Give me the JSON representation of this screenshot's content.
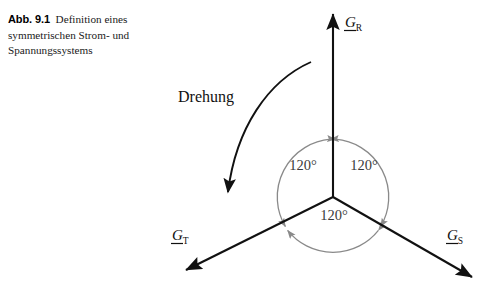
{
  "figure": {
    "caption_number": "Abb. 9.1",
    "caption_text": "Definition eines symmetrischen Strom- und Spannungssystems",
    "background_color": "#ffffff"
  },
  "diagram": {
    "origin": {
      "x": 333,
      "y": 197
    },
    "vector_color": "#111111",
    "arc_color": "#8a8a8a",
    "rotation": {
      "label": "Drehung",
      "direction": "counterclockwise",
      "label_x": 178,
      "label_y": 102
    },
    "vectors": [
      {
        "name": "G_R",
        "symbol": "G",
        "subscript": "R",
        "angle_deg": 90,
        "tip": {
          "x": 333,
          "y": 10
        },
        "label_x": 345,
        "label_y": 27
      },
      {
        "name": "G_S",
        "symbol": "G",
        "subscript": "S",
        "angle_deg": -30,
        "tip": {
          "x": 477,
          "y": 281
        },
        "label_x": 447,
        "label_y": 240
      },
      {
        "name": "G_T",
        "symbol": "G",
        "subscript": "T",
        "angle_deg": 210,
        "tip": {
          "x": 181,
          "y": 273
        },
        "label_x": 172,
        "label_y": 240
      }
    ],
    "angles": [
      {
        "label": "120°",
        "between": "G_T-G_R",
        "x": 303,
        "y": 170
      },
      {
        "label": "120°",
        "between": "G_R-G_S",
        "x": 363,
        "y": 170
      },
      {
        "label": "120°",
        "between": "G_S-G_T",
        "x": 333,
        "y": 219
      }
    ],
    "arc_radius": 58
  }
}
